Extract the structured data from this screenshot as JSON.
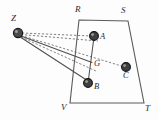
{
  "figure": {
    "width": 159,
    "height": 120,
    "background_color": "#fdfdfd",
    "stroke_color": "#555555",
    "dash_color": "#666666",
    "label_color": "#2b2b2b",
    "node_fill": "#4a4a4a",
    "node_edge": "#1e1e1e"
  },
  "vertices": {
    "R": {
      "label": "R",
      "x": 79,
      "y": 20,
      "label_x": 75,
      "label_y": 8
    },
    "S": {
      "label": "S",
      "x": 128,
      "y": 21,
      "label_x": 122,
      "label_y": 9
    },
    "T": {
      "label": "T",
      "x": 144,
      "y": 103,
      "label_x": 145,
      "label_y": 105
    },
    "V": {
      "label": "V",
      "x": 70,
      "y": 103,
      "label_x": 62,
      "label_y": 104
    }
  },
  "points": {
    "Z": {
      "label": "Z",
      "x": 18,
      "y": 33,
      "r": 4.6,
      "label_x": 12,
      "label_y": 19
    },
    "A": {
      "label": "A",
      "x": 94,
      "y": 36,
      "r": 4.4,
      "label_x": 100,
      "label_y": 35
    },
    "G": {
      "label": "G",
      "x": 92,
      "y": 62,
      "r": 0,
      "label_x": 94,
      "label_y": 65
    },
    "B": {
      "label": "B",
      "x": 88,
      "y": 83,
      "r": 4.4,
      "label_x": 94,
      "label_y": 85
    },
    "C": {
      "label": "C",
      "x": 126,
      "y": 67,
      "r": 4.4,
      "label_x": 123,
      "label_y": 73
    }
  },
  "quadrilateral": {
    "name": "RSTV",
    "path": "M 79 20 L 128 21 L 144 103 L 70 103 Z"
  },
  "segments": {
    "solid": [
      {
        "name": "segment-A-B",
        "from": "A",
        "to": "B",
        "x1": 94,
        "y1": 36,
        "x2": 88,
        "y2": 83
      },
      {
        "name": "segment-Z-G",
        "from": "Z",
        "to": "G",
        "x1": 20,
        "y1": 35,
        "x2": 92,
        "y2": 62
      },
      {
        "name": "segment-Z-B",
        "from": "Z",
        "to": "B",
        "x1": 20,
        "y1": 36,
        "x2": 87,
        "y2": 80
      }
    ],
    "dashed": [
      {
        "name": "ray-Z-A",
        "from": "Z",
        "to": "A",
        "x1": 22,
        "y1": 33,
        "x2": 91,
        "y2": 36
      },
      {
        "name": "ray-Z-R-edge",
        "from": "Z",
        "to": "R-edge",
        "x1": 21,
        "y1": 34,
        "x2": 96,
        "y2": 40
      },
      {
        "name": "ray-Z-C",
        "from": "Z",
        "to": "C",
        "x1": 21,
        "y1": 35,
        "x2": 122,
        "y2": 66
      },
      {
        "name": "ray-Z-lower",
        "from": "Z",
        "to": "lower",
        "x1": 21,
        "y1": 36,
        "x2": 95,
        "y2": 70
      }
    ]
  }
}
